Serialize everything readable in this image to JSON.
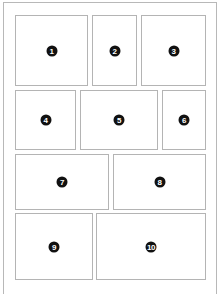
{
  "diagram": {
    "type": "panel-layout",
    "panels": [
      {
        "label": "1",
        "x": 15,
        "y": 15,
        "w": 73,
        "h": 71
      },
      {
        "label": "2",
        "x": 92,
        "y": 15,
        "w": 45,
        "h": 71
      },
      {
        "label": "3",
        "x": 141,
        "y": 15,
        "w": 65,
        "h": 71
      },
      {
        "label": "4",
        "x": 15,
        "y": 90,
        "w": 61,
        "h": 60
      },
      {
        "label": "5",
        "x": 80,
        "y": 90,
        "w": 78,
        "h": 60
      },
      {
        "label": "6",
        "x": 162,
        "y": 90,
        "w": 44,
        "h": 60
      },
      {
        "label": "7",
        "x": 15,
        "y": 154,
        "w": 94,
        "h": 56
      },
      {
        "label": "8",
        "x": 113,
        "y": 154,
        "w": 93,
        "h": 56
      },
      {
        "label": "9",
        "x": 15,
        "y": 213,
        "w": 78,
        "h": 67
      },
      {
        "label": "10",
        "x": 96,
        "y": 213,
        "w": 110,
        "h": 67
      }
    ],
    "colors": {
      "border": "#b4b4b4",
      "badge_fill": "#111111",
      "badge_text": "#ffffff",
      "background": "#ffffff"
    }
  }
}
